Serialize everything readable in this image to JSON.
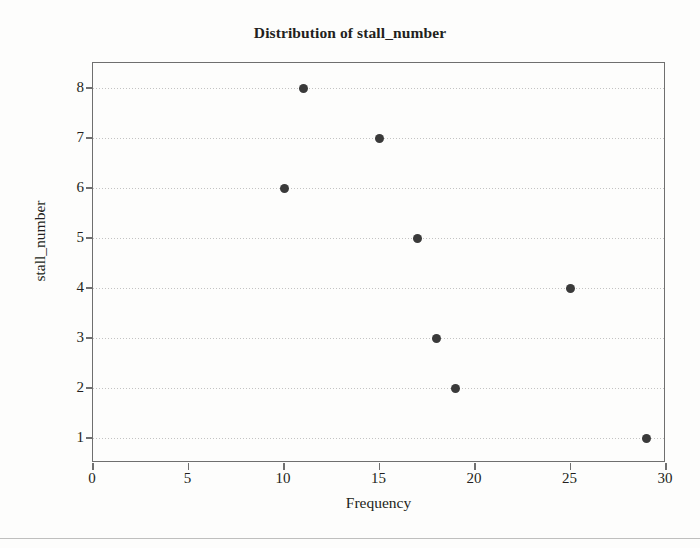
{
  "chart_data": {
    "type": "scatter",
    "title": "Distribution of stall_number",
    "xlabel": "Frequency",
    "ylabel": "stall_number",
    "xlim": [
      0,
      30
    ],
    "ylim": [
      0.5,
      8.5
    ],
    "xticks": [
      "0",
      "5",
      "10",
      "15",
      "20",
      "25",
      "30"
    ],
    "xtick_values": [
      0,
      5,
      10,
      15,
      20,
      25,
      30
    ],
    "yticks": [
      "1",
      "2",
      "3",
      "4",
      "5",
      "6",
      "7",
      "8"
    ],
    "ytick_values": [
      1,
      2,
      3,
      4,
      5,
      6,
      7,
      8
    ],
    "grid": "horizontal-dotted",
    "legend": "none",
    "marker": "filled-circle",
    "marker_color": "#3a3a3a",
    "points": [
      {
        "stall_number": 8,
        "frequency": 11
      },
      {
        "stall_number": 7,
        "frequency": 15
      },
      {
        "stall_number": 6,
        "frequency": 10
      },
      {
        "stall_number": 5,
        "frequency": 17
      },
      {
        "stall_number": 4,
        "frequency": 25
      },
      {
        "stall_number": 3,
        "frequency": 18
      },
      {
        "stall_number": 2,
        "frequency": 19
      },
      {
        "stall_number": 1,
        "frequency": 29
      }
    ]
  },
  "figure": {
    "background_color": "#fdfdfc",
    "axis_color": "#6f6f6f",
    "text_color": "#231f20",
    "grid_color": "#b9b9b9"
  }
}
